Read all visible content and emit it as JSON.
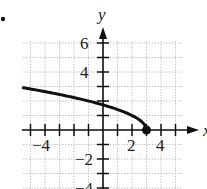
{
  "bullet": "•",
  "chart_data": {
    "type": "line",
    "title": "",
    "function": "y = sqrt(3 - x)",
    "xlabel": "x",
    "ylabel": "y",
    "xlim": [
      -5.5,
      5.5
    ],
    "ylim": [
      -4.2,
      7
    ],
    "grid": true,
    "grid_style": "dotted",
    "x_tick_labels": [
      "-4",
      "2",
      "4"
    ],
    "y_tick_labels": [
      "6",
      "4",
      "-2",
      "-4"
    ],
    "x_ticks": [
      -5,
      -4,
      -3,
      -2,
      -1,
      1,
      2,
      3,
      4,
      5
    ],
    "y_ticks": [
      -4,
      -3,
      -2,
      -1,
      1,
      2,
      3,
      4,
      5,
      6
    ],
    "series": [
      {
        "name": "curve",
        "x": [
          -5.5,
          -4,
          -3,
          -2,
          -1,
          0,
          1,
          2,
          2.5,
          3
        ],
        "y": [
          2.92,
          2.65,
          2.45,
          2.24,
          2.0,
          1.73,
          1.41,
          1.0,
          0.71,
          0.0
        ]
      }
    ],
    "endpoint": {
      "x": 3,
      "y": 0,
      "style": "closed-dot"
    },
    "legend": null
  },
  "colors": {
    "ink": "#111111",
    "grid": "#b8b8b8",
    "background": "#ffffff"
  }
}
